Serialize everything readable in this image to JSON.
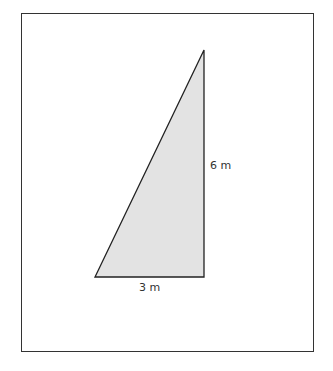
{
  "diagram": {
    "shape": "right-triangle",
    "fill": "#e3e3e3",
    "stroke": "#222222",
    "labels": {
      "height": "6 m",
      "base": "3 m"
    }
  }
}
